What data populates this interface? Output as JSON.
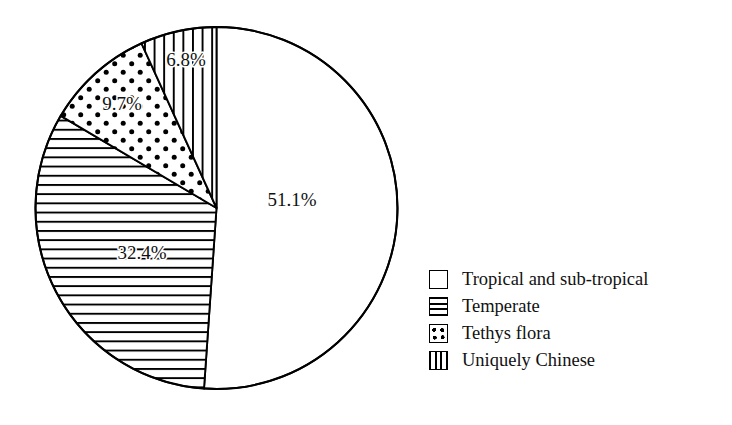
{
  "chart_data": {
    "type": "pie",
    "title": "",
    "subtitle": "",
    "xlabel": "",
    "ylabel": "",
    "grid": false,
    "legend_position": "right",
    "start_angle_deg": 0,
    "direction": "clockwise",
    "units": "percent",
    "categories": [
      "Tropical and sub-tropical",
      "Temperate",
      "Tethys flora",
      "Uniquely Chinese"
    ],
    "values": [
      51.1,
      32.4,
      9.7,
      6.8
    ],
    "data_labels": [
      "51.1%",
      "32.4%",
      "9.7%",
      "6.8%"
    ],
    "slices": [
      {
        "name": "Tropical and sub-tropical",
        "value": 51.1,
        "label": "51.1%",
        "pattern": "solid-white",
        "start_deg": 0.0,
        "end_deg": 183.96
      },
      {
        "name": "Temperate",
        "value": 32.4,
        "label": "32.4%",
        "pattern": "horizontal-lines",
        "start_deg": 183.96,
        "end_deg": 300.6
      },
      {
        "name": "Tethys flora",
        "value": 9.7,
        "label": "9.7%",
        "pattern": "dots",
        "start_deg": 300.6,
        "end_deg": 335.52
      },
      {
        "name": "Uniquely Chinese",
        "value": 6.8,
        "label": "6.8%",
        "pattern": "vertical-lines",
        "start_deg": 335.52,
        "end_deg": 360.0
      }
    ],
    "colors": {
      "outline": "#000000",
      "background": "#ffffff",
      "pattern_ink": "#000000",
      "label_text": "#111111"
    }
  },
  "legend": {
    "items": [
      {
        "label": "Tropical and sub-tropical",
        "pattern": "solid-white"
      },
      {
        "label": "Temperate",
        "pattern": "horizontal-lines"
      },
      {
        "label": "Tethys flora",
        "pattern": "dots"
      },
      {
        "label": "Uniquely Chinese",
        "pattern": "vertical-lines"
      }
    ]
  },
  "labels": {
    "tropical": "51.1%",
    "temperate": "32.4%",
    "tethys": "9.7%",
    "chinese": "6.8%"
  }
}
